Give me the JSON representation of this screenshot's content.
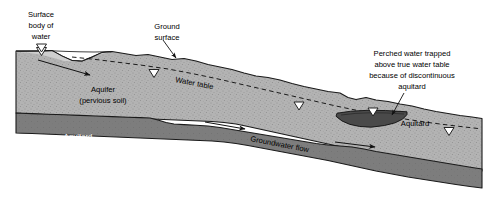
{
  "figure": {
    "type": "cross-section-diagram",
    "colors": {
      "aquifer_fill": "#b3b3b3",
      "aquitard_fill": "#7d7d7d",
      "water_fill": "#cccccc",
      "outline": "#1a1a1a",
      "background": "#ffffff",
      "label_text": "#000000",
      "aquitard_label_text": "#ffffff"
    }
  },
  "labels": {
    "surface_body_of_water": [
      "Surface",
      "body of",
      "water"
    ],
    "ground_surface": [
      "Ground",
      "surface"
    ],
    "water_table": "Water table",
    "aquifer": [
      "Aquifer",
      "(pervious soil)"
    ],
    "aquitard_main": [
      "Aquitard",
      "(impervious soil",
      "or rock)"
    ],
    "groundwater_flow": "Groundwater flow",
    "perched_note": [
      "Perched water trapped",
      "above true water table",
      "because of discontinuous",
      "aquitard"
    ],
    "aquitard_perched": "Aquitard"
  },
  "symbols": {
    "water_table_marker": "water-table-triangle",
    "marker_count": 5,
    "flow_arrow_count": 3,
    "leader_line_count": 2
  }
}
